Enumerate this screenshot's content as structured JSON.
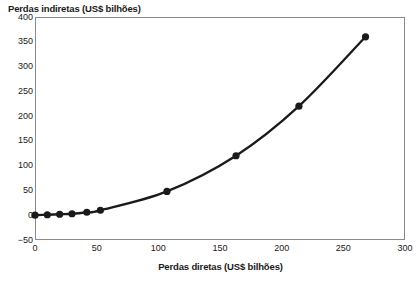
{
  "chart_data": {
    "type": "line",
    "title": "",
    "ylabel": "Perdas indiretas (US$ bilhões)",
    "xlabel": "Perdas diretas (US$ bilhões)",
    "xlim": [
      0,
      300
    ],
    "ylim": [
      -50,
      400
    ],
    "xticks": [
      0,
      50,
      100,
      150,
      200,
      250,
      300
    ],
    "yticks": [
      -50,
      0,
      50,
      100,
      150,
      200,
      250,
      300,
      350,
      400
    ],
    "xtick_labels": [
      "0",
      "50",
      "100",
      "150",
      "200",
      "250",
      "300"
    ],
    "ytick_labels": [
      "-50",
      "0",
      "50",
      "100",
      "150",
      "200",
      "250",
      "300",
      "350",
      "400"
    ],
    "grid": false,
    "legend": "none",
    "series": [
      {
        "name": "Perdas indiretas vs. perdas diretas",
        "marker": "filled-circle",
        "marker_color": "#1a1a1a",
        "line_color": "#1a1a1a",
        "x": [
          0,
          10,
          20,
          30,
          42,
          53,
          107,
          163,
          214,
          268
        ],
        "y": [
          0,
          1,
          2,
          3,
          6,
          10,
          48,
          120,
          220,
          360
        ]
      }
    ]
  },
  "axes": {
    "y_title": "Perdas indiretas (US$ bilhões)",
    "x_title": "Perdas diretas (US$ bilhões)"
  },
  "colors": {
    "ink": "#1a1a1a",
    "frame": "#8a8a8a",
    "background": "#ffffff"
  }
}
